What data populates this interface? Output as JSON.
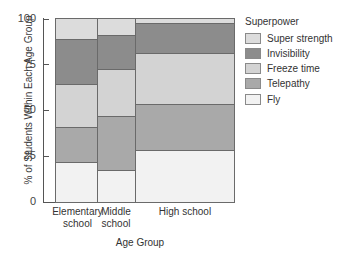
{
  "chart_data": {
    "type": "bar",
    "subtype": "stacked-100-percent-variable-width (mosaic)",
    "title": "",
    "xlabel": "Age Group",
    "ylabel": "% of Students Within Each Age Group",
    "ylim": [
      0,
      100
    ],
    "yticks": [
      0,
      25,
      50,
      75,
      100
    ],
    "grid": false,
    "legend_title": "Superpower",
    "legend_position": "right",
    "categories": [
      "Elementary school",
      "Middle school",
      "High school"
    ],
    "category_widths_px": [
      42,
      38,
      99
    ],
    "series": [
      {
        "name": "Fly",
        "color": "#f2f2f2",
        "values": [
          22,
          17.5,
          28
        ]
      },
      {
        "name": "Telepathy",
        "color": "#a9a9a9",
        "values": [
          19,
          29.5,
          25.5
        ]
      },
      {
        "name": "Freeze time",
        "color": "#d3d3d3",
        "values": [
          23,
          25.5,
          27.5
        ]
      },
      {
        "name": "Invisibility",
        "color": "#8c8c8c",
        "values": [
          24.5,
          18,
          16.5
        ]
      },
      {
        "name": "Super strength",
        "color": "#dcdcdc",
        "values": [
          11.5,
          9.5,
          2.5
        ]
      }
    ],
    "cumulative_tops": {
      "Elementary school": [
        22,
        41,
        64,
        88.5,
        100
      ],
      "Middle school": [
        17.5,
        47,
        72.5,
        90.5,
        100
      ],
      "High school": [
        28,
        53.5,
        81,
        97.5,
        100
      ]
    }
  },
  "axis": {
    "y_title": "% of Students Within Each Age Group",
    "y_ticks": [
      "0",
      "25",
      "50",
      "75",
      "100"
    ],
    "x_title": "Age Group",
    "x_categories": [
      {
        "line1": "Elementary",
        "line2": "school"
      },
      {
        "line1": "Middle",
        "line2": "school"
      },
      {
        "line1": "High school",
        "line2": ""
      }
    ]
  },
  "legend": {
    "title": "Superpower",
    "items": [
      {
        "label": "Super strength",
        "color": "#dcdcdc"
      },
      {
        "label": "Invisibility",
        "color": "#8c8c8c"
      },
      {
        "label": "Freeze time",
        "color": "#d3d3d3"
      },
      {
        "label": "Telepathy",
        "color": "#a9a9a9"
      },
      {
        "label": "Fly",
        "color": "#f2f2f2"
      }
    ]
  }
}
